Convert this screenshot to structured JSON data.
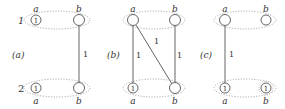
{
  "colors": {
    "stroke": "#555555",
    "dotted": "#999999",
    "text": "#333333",
    "background": "#ffffff"
  },
  "row_labels": {
    "top": "1",
    "bottom": "2"
  },
  "panels": [
    {
      "id": "a",
      "label": "(a)",
      "nodes": {
        "top_a": {
          "name": "a",
          "marked": "1"
        },
        "top_b": {
          "name": "b",
          "marked": ""
        },
        "bottom_a": {
          "name": "a",
          "marked": "1"
        },
        "bottom_b": {
          "name": "b",
          "marked": ""
        }
      },
      "edges": [
        {
          "from": "top_b",
          "to": "bottom_b",
          "weight": "1"
        }
      ]
    },
    {
      "id": "b",
      "label": "(b)",
      "nodes": {
        "top_a": {
          "name": "a",
          "marked": ""
        },
        "top_b": {
          "name": "b",
          "marked": ""
        },
        "bottom_a": {
          "name": "a",
          "marked": "1"
        },
        "bottom_b": {
          "name": "b",
          "marked": ""
        }
      },
      "edges": [
        {
          "from": "top_a",
          "to": "bottom_a",
          "weight": "1"
        },
        {
          "from": "top_a",
          "to": "bottom_b",
          "weight": "1"
        },
        {
          "from": "top_b",
          "to": "bottom_b",
          "weight": "1"
        }
      ]
    },
    {
      "id": "c",
      "label": "(c)",
      "nodes": {
        "top_a": {
          "name": "a",
          "marked": ""
        },
        "top_b": {
          "name": "b",
          "marked": ""
        },
        "bottom_a": {
          "name": "a",
          "marked": "1"
        },
        "bottom_b": {
          "name": "b",
          "marked": "1"
        }
      },
      "edges": [
        {
          "from": "top_a",
          "to": "bottom_a",
          "weight": "1"
        }
      ]
    }
  ]
}
